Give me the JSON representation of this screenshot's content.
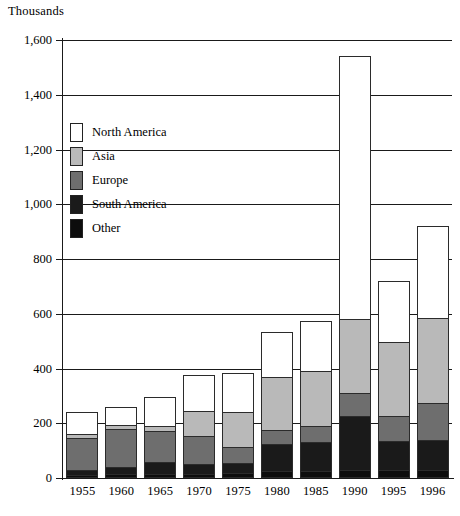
{
  "chart_data": {
    "type": "bar",
    "subtype": "stacked-bar",
    "title": "",
    "unit_label": "Thousands",
    "xlabel": "",
    "ylabel": "",
    "categories": [
      "1955",
      "1960",
      "1965",
      "1970",
      "1975",
      "1980",
      "1985",
      "1990",
      "1995",
      "1996"
    ],
    "ylim": [
      0,
      1600
    ],
    "yticks": [
      0,
      200,
      400,
      600,
      800,
      1000,
      1200,
      1400,
      1600
    ],
    "ytick_labels": [
      "0",
      "200",
      "400",
      "600",
      "800",
      "1,000",
      "1,200",
      "1,400",
      "1,600"
    ],
    "grid": true,
    "legend_position": "inside-upper-left",
    "stack_order_bottom_to_top": [
      "Other",
      "South America",
      "Europe",
      "Asia",
      "North America"
    ],
    "series": [
      {
        "name": "Other",
        "color": "#0d0d0d",
        "values": [
          10,
          15,
          15,
          15,
          20,
          25,
          25,
          30,
          30,
          30
        ]
      },
      {
        "name": "South America",
        "color": "#1a1a1a",
        "values": [
          20,
          25,
          45,
          35,
          35,
          100,
          105,
          195,
          105,
          110
        ]
      },
      {
        "name": "Europe",
        "color": "#6e6e6e",
        "values": [
          115,
          140,
          110,
          105,
          60,
          50,
          60,
          85,
          90,
          135
        ]
      },
      {
        "name": "Asia",
        "color": "#b9b9b9",
        "values": [
          15,
          15,
          20,
          90,
          125,
          195,
          200,
          270,
          270,
          310
        ]
      },
      {
        "name": "North America",
        "color": "#ffffff",
        "values": [
          80,
          65,
          105,
          130,
          145,
          165,
          185,
          960,
          225,
          335
        ]
      }
    ],
    "totals": [
      240,
      260,
      295,
      375,
      385,
      535,
      575,
      1540,
      720,
      920
    ]
  },
  "legend": {
    "entries": [
      {
        "label": "North America",
        "color": "#ffffff"
      },
      {
        "label": "Asia",
        "color": "#b9b9b9"
      },
      {
        "label": "Europe",
        "color": "#6e6e6e"
      },
      {
        "label": "South America",
        "color": "#1a1a1a"
      },
      {
        "label": "Other",
        "color": "#0d0d0d"
      }
    ]
  }
}
